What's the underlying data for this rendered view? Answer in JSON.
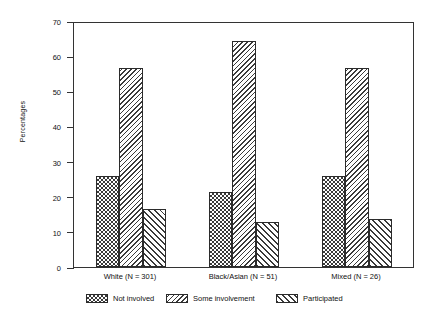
{
  "chart_data": {
    "type": "bar",
    "title": "",
    "xlabel": "",
    "ylabel": "Percentages",
    "ylim": [
      0,
      70
    ],
    "yticks": [
      0,
      10,
      20,
      30,
      40,
      50,
      60,
      70
    ],
    "grid": false,
    "legend_position": "bottom",
    "categories": [
      "White (N = 301)",
      "Black/Asian (N = 51)",
      "Mixed (N = 26)"
    ],
    "series": [
      {
        "name": "Not involved",
        "pattern": "checkerboard",
        "values": [
          25.8,
          21.3,
          25.9
        ]
      },
      {
        "name": "Some involvement",
        "pattern": "backslash-hatch",
        "values": [
          56.7,
          64.2,
          56.7
        ]
      },
      {
        "name": "Participated",
        "pattern": "forward-slash-hatch",
        "values": [
          16.6,
          12.9,
          13.6
        ]
      }
    ]
  },
  "colors": {
    "ink": "#2b2b2b",
    "background": "#ffffff",
    "hatch": "#3a3a3a"
  }
}
